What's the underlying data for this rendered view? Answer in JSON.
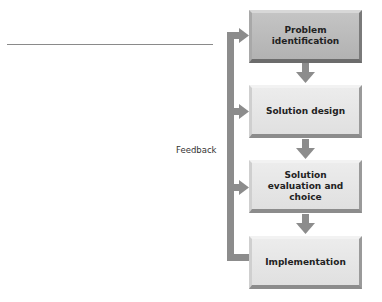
{
  "diagram": {
    "steps": [
      {
        "label": "Problem identification",
        "style": "dark"
      },
      {
        "label": "Solution design",
        "style": "light"
      },
      {
        "label": "Solution evaluation and choice",
        "style": "light"
      },
      {
        "label": "Implementation",
        "style": "light"
      }
    ],
    "feedback_label": "Feedback",
    "colors": {
      "arrow": "#8c8c8c",
      "box_dark": "#b8b8b8",
      "box_light": "#e4e4e4",
      "text": "#222222"
    }
  }
}
